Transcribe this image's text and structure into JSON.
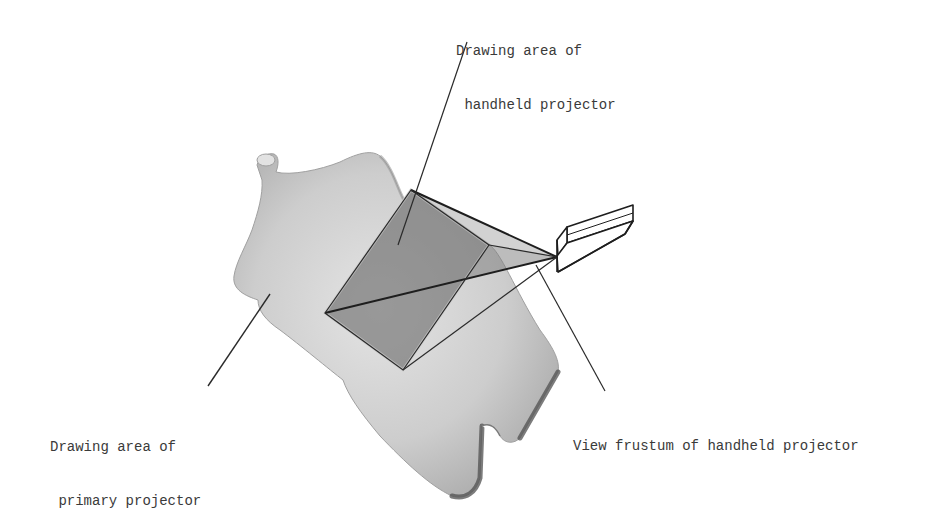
{
  "figure": {
    "labels": {
      "handheld_area": {
        "line1": "Drawing area of",
        "line2": " handheld projector"
      },
      "primary_area": {
        "line1": "Drawing area of",
        "line2": " primary projector"
      },
      "frustum": {
        "line1": "View frustum of handheld projector"
      }
    },
    "colors": {
      "body_fill": "#cfcfcf",
      "body_shadow": "#8a8a8a",
      "frustum_fill": "#7d7d7d",
      "line": "#2a2a2a",
      "text": "#3a3a3a"
    }
  }
}
